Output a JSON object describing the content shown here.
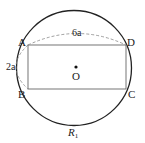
{
  "diagram": {
    "points": {
      "A": "A",
      "B": "B",
      "C": "C",
      "D": "D",
      "O": "O"
    },
    "labels": {
      "top_length": "6a",
      "left_length": "2a",
      "radius_label": "R",
      "radius_subscript": "1"
    },
    "colors": {
      "circle": "#222222",
      "rectangle": "#666666",
      "dashed": "#888888"
    }
  }
}
